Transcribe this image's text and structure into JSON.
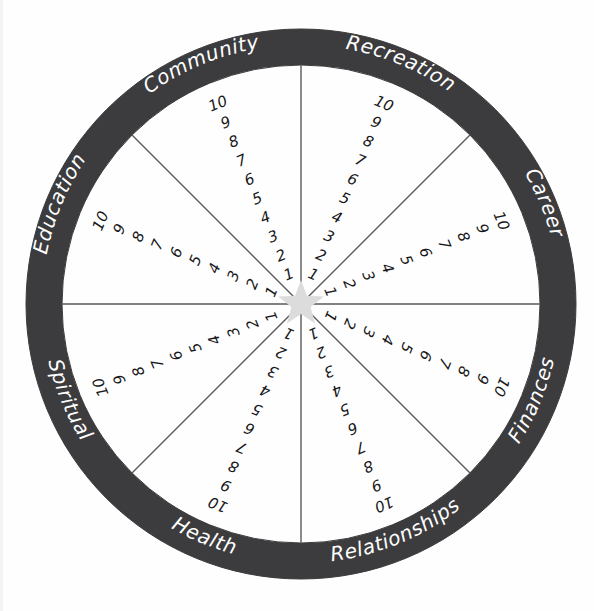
{
  "colors": {
    "ring": "#3c3c3e",
    "ring_text": "#ffffff",
    "background": "#fefefe",
    "spoke_line": "#5a5a5c",
    "number_text": "#18181a",
    "center_star": "#dcdcdc",
    "outer_circle_stroke": "#3c3c3e"
  },
  "geometry": {
    "center_x": 301,
    "center_y": 304,
    "outer_radius": 275,
    "inner_radius": 239,
    "star_radius": 24,
    "segment_count": 8,
    "scale_min": 1,
    "scale_max": 10
  },
  "segments": [
    {
      "id": "recreation",
      "label": "Recreation",
      "mid_angle_deg": -67.5,
      "scale": [
        1,
        2,
        3,
        4,
        5,
        6,
        7,
        8,
        9,
        10
      ]
    },
    {
      "id": "career",
      "label": "Career",
      "mid_angle_deg": -22.5,
      "scale": [
        1,
        2,
        3,
        4,
        5,
        6,
        7,
        8,
        9,
        10
      ]
    },
    {
      "id": "finances",
      "label": "Finances",
      "mid_angle_deg": 22.5,
      "scale": [
        1,
        2,
        3,
        4,
        5,
        6,
        7,
        8,
        9,
        10
      ]
    },
    {
      "id": "relationships",
      "label": "Relationships",
      "mid_angle_deg": 67.5,
      "scale": [
        1,
        2,
        3,
        4,
        5,
        6,
        7,
        8,
        9,
        10
      ]
    },
    {
      "id": "health",
      "label": "Health",
      "mid_angle_deg": 112.5,
      "scale": [
        1,
        2,
        3,
        4,
        5,
        6,
        7,
        8,
        9,
        10
      ]
    },
    {
      "id": "spiritual",
      "label": "Spiritual",
      "mid_angle_deg": 157.5,
      "scale": [
        1,
        2,
        3,
        4,
        5,
        6,
        7,
        8,
        9,
        10
      ]
    },
    {
      "id": "education",
      "label": "Education",
      "mid_angle_deg": 202.5,
      "scale": [
        1,
        2,
        3,
        4,
        5,
        6,
        7,
        8,
        9,
        10
      ]
    },
    {
      "id": "community",
      "label": "Community",
      "mid_angle_deg": 247.5,
      "scale": [
        1,
        2,
        3,
        4,
        5,
        6,
        7,
        8,
        9,
        10
      ]
    }
  ],
  "center": {
    "icon": "star-icon"
  }
}
